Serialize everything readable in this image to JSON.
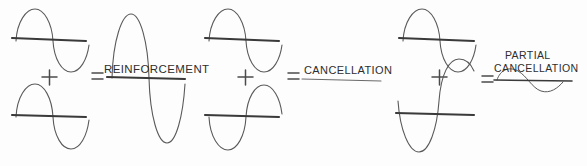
{
  "figure": {
    "background_color": "#fdfdfd",
    "wave_stroke_color": "#5a5a5a",
    "axis_stroke_color": "#3a3a3a",
    "text_color": "#2e2e2e",
    "width": 587,
    "height": 166
  },
  "operators": {
    "plus": "+",
    "equals": "="
  },
  "groups": [
    {
      "id": "reinforcement",
      "operator_plus": "+",
      "operator_equals": "=",
      "result_label": "REINFORCEMENT",
      "result_label_lines": [
        "REINFORCEMENT"
      ],
      "top_wave": {
        "name": "input-wave-top",
        "phase": "positive-first",
        "amplitude_relative": 1.0,
        "cycles": 1
      },
      "bottom_wave": {
        "name": "input-wave-bottom",
        "phase": "positive-first",
        "amplitude_relative": 1.0,
        "cycles": 1
      },
      "result_wave": {
        "name": "result-wave",
        "phase": "positive-first",
        "amplitude_relative": 2.0,
        "cycles": 1
      }
    },
    {
      "id": "cancellation",
      "operator_plus": "+",
      "operator_equals": "=",
      "result_label": "CANCELLATION",
      "result_label_lines": [
        "CANCELLATION"
      ],
      "top_wave": {
        "name": "input-wave-top",
        "phase": "positive-first",
        "amplitude_relative": 1.0,
        "cycles": 1
      },
      "bottom_wave": {
        "name": "input-wave-bottom",
        "phase": "negative-first",
        "amplitude_relative": 1.0,
        "cycles": 1
      },
      "result_wave": {
        "name": "result-flat-line",
        "phase": "none",
        "amplitude_relative": 0.0,
        "cycles": 0
      }
    },
    {
      "id": "partial-cancellation",
      "operator_plus": "+",
      "operator_equals": "=",
      "result_label": "PARTIAL CANCELLATION",
      "result_label_lines": [
        "PARTIAL",
        "CANCELLATION"
      ],
      "top_wave": {
        "name": "input-wave-top",
        "phase": "positive-first",
        "amplitude_relative": 1.0,
        "cycles": 1
      },
      "bottom_wave": {
        "name": "input-wave-bottom",
        "phase": "negative-first",
        "amplitude_relative": 1.35,
        "cycles": 1
      },
      "result_wave": {
        "name": "result-wave",
        "phase": "positive-first",
        "amplitude_relative": 0.28,
        "cycles": 1
      }
    }
  ]
}
